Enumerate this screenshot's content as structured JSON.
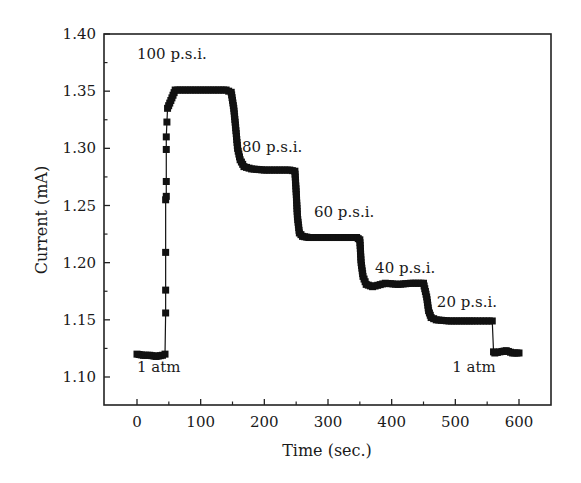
{
  "chart_data": {
    "type": "scatter",
    "title": "",
    "xlabel": "Time (sec.)",
    "ylabel": "Current (mA)",
    "xlim": [
      -50,
      650
    ],
    "ylim": [
      1.075,
      1.4
    ],
    "xticks": [
      0,
      100,
      200,
      300,
      400,
      500,
      600
    ],
    "xminor": [
      50,
      150,
      250,
      350,
      450,
      550
    ],
    "yticks": [
      1.1,
      1.15,
      1.2,
      1.25,
      1.3,
      1.35,
      1.4
    ],
    "yminor": [
      1.125,
      1.175,
      1.225,
      1.275,
      1.325,
      1.375
    ],
    "ytick_labels": [
      "1.10",
      "1.15",
      "1.20",
      "1.25",
      "1.30",
      "1.35",
      "1.40"
    ],
    "grid": false,
    "legend": null,
    "marker": "square",
    "color": "#111111",
    "series": [
      {
        "name": "Current vs time at varying pressure",
        "x": [
          0,
          10,
          20,
          30,
          40,
          44,
          45,
          45,
          45,
          45,
          46,
          46,
          46,
          46,
          47,
          48,
          60,
          80,
          100,
          120,
          140,
          148,
          152,
          155,
          158,
          162,
          168,
          180,
          200,
          220,
          240,
          248,
          250,
          252,
          255,
          260,
          270,
          290,
          310,
          330,
          345,
          350,
          352,
          355,
          360,
          370,
          390,
          410,
          430,
          450,
          455,
          458,
          462,
          470,
          490,
          510,
          530,
          558,
          560,
          562,
          570,
          580,
          590,
          600
        ],
        "y": [
          1.12,
          1.119,
          1.119,
          1.118,
          1.119,
          1.12,
          1.156,
          1.176,
          1.209,
          1.255,
          1.258,
          1.271,
          1.299,
          1.31,
          1.323,
          1.335,
          1.351,
          1.351,
          1.351,
          1.351,
          1.351,
          1.349,
          1.335,
          1.318,
          1.3,
          1.29,
          1.284,
          1.282,
          1.281,
          1.281,
          1.281,
          1.28,
          1.262,
          1.24,
          1.226,
          1.223,
          1.222,
          1.222,
          1.222,
          1.222,
          1.222,
          1.22,
          1.2,
          1.188,
          1.181,
          1.179,
          1.182,
          1.181,
          1.182,
          1.182,
          1.17,
          1.158,
          1.152,
          1.15,
          1.149,
          1.149,
          1.149,
          1.149,
          1.122,
          1.121,
          1.122,
          1.123,
          1.121,
          1.121
        ]
      }
    ],
    "annotations": [
      {
        "text": "100 p.s.i.",
        "x": 0,
        "y": 1.378
      },
      {
        "text": "80 p.s.i.",
        "x": 165,
        "y": 1.297
      },
      {
        "text": "60 p.s.i.",
        "x": 278,
        "y": 1.24
      },
      {
        "text": "40 p.s.i.",
        "x": 374,
        "y": 1.191
      },
      {
        "text": "20 p.s.i.",
        "x": 471,
        "y": 1.161
      },
      {
        "text": "1 atm",
        "x": 0,
        "y": 1.104
      },
      {
        "text": "1 atm",
        "x": 495,
        "y": 1.104
      }
    ]
  },
  "axes": {
    "x_title": "Time (sec.)",
    "y_title": "Current (mA)"
  }
}
